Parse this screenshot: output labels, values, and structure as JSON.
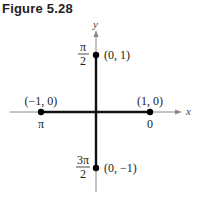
{
  "figure": {
    "title": "Figure 5.28",
    "axes": {
      "x_label": "x",
      "y_label": "y"
    },
    "points": [
      {
        "coord": "(0, 1)",
        "angle_num": "π",
        "angle_den": "2"
      },
      {
        "coord": "(−1, 0)",
        "angle": "π"
      },
      {
        "coord": "(1, 0)",
        "angle": "0"
      },
      {
        "coord": "(0, −1)",
        "angle_num": "3π",
        "angle_den": "2"
      }
    ],
    "colors": {
      "axis_light": "#888888",
      "axis_dark": "#111111",
      "point": "#000000"
    }
  }
}
